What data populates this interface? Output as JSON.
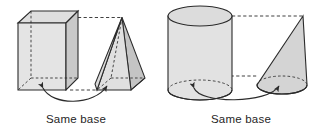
{
  "figure": {
    "background_color": "#ffffff",
    "stroke_color": "#2b2b2b",
    "fill_light": "#e4e4e4",
    "fill_mid": "#d6d6d6",
    "fill_dark": "#c4c4c4",
    "fill_top": "#dedede",
    "groups": [
      {
        "id": "prism-pyramid",
        "caption": "Same base",
        "solids": [
          {
            "name": "rectangular-prism",
            "label": "rectangular prism"
          },
          {
            "name": "rectangular-pyramid",
            "label": "pyramid"
          }
        ],
        "connector": {
          "type": "double-headed-curved-arrow",
          "meaning": "same base"
        },
        "height_guides": 2
      },
      {
        "id": "cylinder-cone",
        "caption": "Same base",
        "solids": [
          {
            "name": "cylinder",
            "label": "cylinder"
          },
          {
            "name": "cone",
            "label": "cone"
          }
        ],
        "connector": {
          "type": "double-headed-curved-arrow",
          "meaning": "same base"
        },
        "height_guides": 2
      }
    ]
  },
  "captions": {
    "left": "Same base",
    "right": "Same base"
  }
}
